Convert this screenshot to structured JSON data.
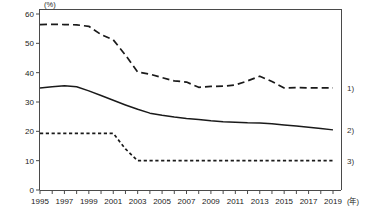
{
  "chart_data": {
    "type": "line",
    "title": "",
    "subtitle": "",
    "xlabel": "(年)",
    "ylabel": "(%)",
    "xlim": [
      1995,
      2019
    ],
    "ylim": [
      0,
      60
    ],
    "grid": false,
    "legend_position": "right-edge",
    "y_ticks": [
      0,
      10,
      20,
      30,
      40,
      50,
      60
    ],
    "y_tick_labels": [
      "0",
      "10",
      "20",
      "30",
      "40",
      "50",
      "60"
    ],
    "x_ticks": [
      1995,
      1996,
      1997,
      1998,
      1999,
      2000,
      2001,
      2002,
      2003,
      2004,
      2005,
      2006,
      2007,
      2008,
      2009,
      2010,
      2011,
      2012,
      2013,
      2014,
      2015,
      2016,
      2017,
      2018,
      2019
    ],
    "x_tick_labels": [
      "1995",
      "",
      "1997",
      "",
      "1999",
      "",
      "2001",
      "",
      "2003",
      "",
      "2005",
      "",
      "2007",
      "",
      "2009",
      "",
      "2011",
      "",
      "2013",
      "",
      "2015",
      "",
      "2017",
      "",
      "2019"
    ],
    "x": [
      1995,
      1996,
      1997,
      1998,
      1999,
      2000,
      2001,
      2002,
      2003,
      2004,
      2005,
      2006,
      2007,
      2008,
      2009,
      2010,
      2011,
      2012,
      2013,
      2014,
      2015,
      2016,
      2017,
      2018,
      2019
    ],
    "series": [
      {
        "name": "1)",
        "style": "dashed",
        "values": [
          56.4,
          56.5,
          56.4,
          56.3,
          55.8,
          53.0,
          51.2,
          46.0,
          40.2,
          39.5,
          38.3,
          37.2,
          36.8,
          35.0,
          35.3,
          35.4,
          35.8,
          37.2,
          38.8,
          37.0,
          34.8,
          34.9,
          34.8,
          34.8,
          34.8
        ]
      },
      {
        "name": "2)",
        "style": "solid",
        "values": [
          34.8,
          35.2,
          35.5,
          35.2,
          33.8,
          32.2,
          30.6,
          29.0,
          27.5,
          26.2,
          25.5,
          24.9,
          24.4,
          24.0,
          23.6,
          23.3,
          23.1,
          22.9,
          22.8,
          22.6,
          22.2,
          21.8,
          21.4,
          21.0,
          20.5
        ]
      },
      {
        "name": "3)",
        "style": "dotted",
        "values": [
          19.3,
          19.3,
          19.3,
          19.3,
          19.3,
          19.3,
          19.3,
          14.0,
          10.0,
          10.0,
          10.0,
          10.0,
          10.0,
          10.0,
          10.0,
          10.0,
          10.0,
          10.0,
          10.0,
          10.0,
          10.0,
          10.0,
          10.0,
          10.0,
          10.0
        ]
      }
    ],
    "series_labels": [
      "1)",
      "2)",
      "3)"
    ],
    "colors": {
      "line": "#1a1a1a",
      "axis": "#4a4a4a",
      "text": "#222222",
      "background": "#ffffff"
    }
  }
}
